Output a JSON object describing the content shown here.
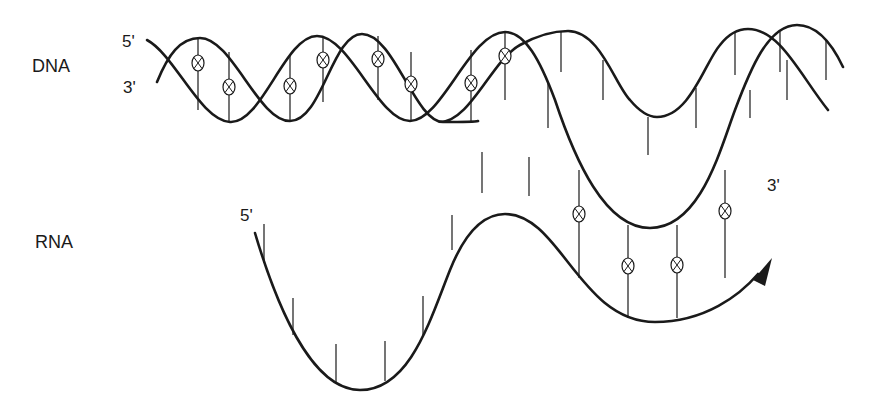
{
  "labels": {
    "dna": "DNA",
    "rna": "RNA",
    "dna_top_end": "5'",
    "dna_bottom_end": "3'",
    "rna_start": "5'",
    "rna_end": "3'"
  },
  "colors": {
    "stroke": "#1a1a1a",
    "background": "#ffffff"
  },
  "diagram": {
    "elements": [
      "DNA double helix",
      "unwound template strand",
      "RNA transcript with arrow toward 3' end",
      "base-pair markers (circled X)"
    ]
  }
}
